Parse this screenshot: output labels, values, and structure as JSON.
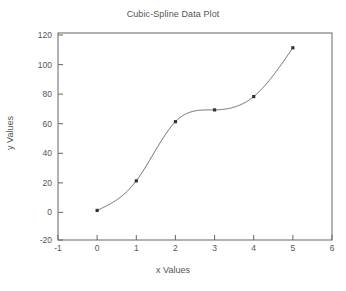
{
  "chart_data": {
    "type": "line",
    "title": "Cubic-Spline Data Plot",
    "xlabel": "x Values",
    "ylabel": "y Values",
    "xlim": [
      -1,
      6
    ],
    "ylim": [
      -20,
      120
    ],
    "xticks": [
      -1,
      0,
      1,
      2,
      3,
      4,
      5,
      6
    ],
    "xtick_labels": [
      "-1",
      "0",
      "1",
      "2",
      "3",
      "4",
      "5",
      "6"
    ],
    "yticks": [
      -20,
      0,
      20,
      40,
      60,
      80,
      100,
      120
    ],
    "ytick_labels": [
      "-20",
      "0",
      "20",
      "40",
      "60",
      "80",
      "100",
      "120"
    ],
    "grid": false,
    "legend": false,
    "series": [
      {
        "name": "Cubic spline",
        "interpolation": "cubic-spline",
        "line_color": "#555555",
        "marker": "square",
        "marker_color": "#333333",
        "x": [
          0,
          1,
          2,
          3,
          4,
          5
        ],
        "values": [
          0,
          20,
          60,
          68,
          77,
          110
        ]
      }
    ]
  },
  "axes": {
    "frame_color": "#666666",
    "background": "#ffffff"
  }
}
